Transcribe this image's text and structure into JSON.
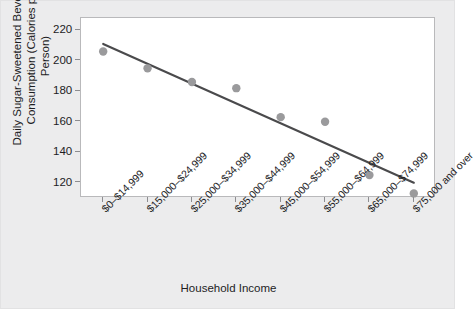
{
  "chart_data": {
    "type": "scatter",
    "title": "",
    "xlabel": "Household Income",
    "ylabel": "Daily Sugar-Sweetened Beverages Consumption (Calories per Person)",
    "ylabel_line1": "Daily Sugar-Sweetened Beverages",
    "ylabel_line2": "Consumption (Calories per Person)",
    "categories": [
      "$0–$14,999",
      "$15,000–$24,999",
      "$25,000–$34,999",
      "$35,000–$44,999",
      "$45,000–$54,999",
      "$55,000–$64,999",
      "$65,000–$74,999",
      "$75,000 and over"
    ],
    "values": [
      206,
      195,
      186,
      182,
      163,
      160,
      125,
      113
    ],
    "ylim": [
      110,
      228
    ],
    "yticks": [
      120,
      140,
      160,
      180,
      200,
      220
    ],
    "ytick_labels": [
      "120",
      "140",
      "160",
      "180",
      "200",
      "220"
    ],
    "grid": false,
    "legend": null,
    "trendline": {
      "type": "linear-fit",
      "x_start_category_index": 0,
      "x_end_category_index": 7,
      "y_start": 211,
      "y_end": 120
    },
    "marker": {
      "shape": "circle",
      "color": "#9a9a9c",
      "radius": 4.2
    },
    "colors": {
      "point": "#9a9a9c",
      "trendline": "#4a4a4c",
      "axis": "#8d8d90",
      "plot_background": "#ffffff",
      "figure_background": "#ececed",
      "text": "#1d1d1f"
    }
  }
}
